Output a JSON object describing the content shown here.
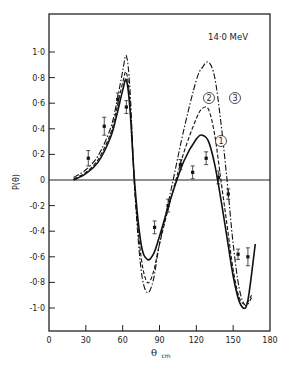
{
  "chart_data": {
    "type": "line",
    "title": "14·0 MeV",
    "xlabel": "θ",
    "xlabel_sub": "cm",
    "ylabel": "P(θ)",
    "xlim": [
      0,
      180
    ],
    "ylim": [
      -1.2,
      1.2
    ],
    "x_ticks": [
      0,
      30,
      60,
      90,
      120,
      150,
      180
    ],
    "x_tick_labels": [
      "0",
      "30",
      "60",
      "90",
      "120",
      "150",
      "180"
    ],
    "y_ticks": [
      1.0,
      0.8,
      0.6,
      0.4,
      0.2,
      0,
      -0.2,
      -0.4,
      -0.6,
      -0.8,
      -1.0
    ],
    "y_tick_labels": [
      "1·0",
      "0·8",
      "0·6",
      "0·4",
      "0·2",
      "0",
      "-0·2",
      "-0·4",
      "-0·6",
      "-0·8",
      "-1·0"
    ],
    "grid": false,
    "legend": "curve labels circled 1, 2, 3",
    "series": [
      {
        "name": "1",
        "style": "solid",
        "x": [
          20,
          30,
          40,
          50,
          55,
          60,
          63,
          66,
          70,
          75,
          80,
          85,
          90,
          100,
          110,
          120,
          125,
          130,
          135,
          140,
          145,
          150,
          155,
          160,
          163,
          168
        ],
        "y": [
          0.0,
          0.05,
          0.14,
          0.33,
          0.5,
          0.7,
          0.78,
          0.55,
          -0.05,
          -0.5,
          -0.62,
          -0.58,
          -0.44,
          -0.12,
          0.15,
          0.32,
          0.35,
          0.3,
          0.12,
          -0.15,
          -0.45,
          -0.75,
          -0.95,
          -1.0,
          -0.88,
          -0.5
        ]
      },
      {
        "name": "2",
        "style": "dashed",
        "x": [
          20,
          30,
          40,
          50,
          55,
          60,
          63,
          66,
          70,
          75,
          80,
          85,
          90,
          100,
          110,
          120,
          125,
          130,
          135,
          140,
          145,
          150,
          155,
          160,
          165
        ],
        "y": [
          0.01,
          0.06,
          0.16,
          0.36,
          0.55,
          0.76,
          0.84,
          0.6,
          -0.1,
          -0.6,
          -0.8,
          -0.72,
          -0.5,
          -0.12,
          0.22,
          0.48,
          0.56,
          0.55,
          0.35,
          0.0,
          -0.35,
          -0.7,
          -0.92,
          -0.97,
          -0.9
        ]
      },
      {
        "name": "3",
        "style": "dash-dot",
        "x": [
          20,
          30,
          40,
          50,
          55,
          60,
          63,
          66,
          70,
          75,
          80,
          85,
          90,
          100,
          110,
          120,
          125,
          130,
          135,
          140,
          145,
          150,
          155,
          160,
          165
        ],
        "y": [
          0.02,
          0.08,
          0.19,
          0.4,
          0.6,
          0.85,
          0.97,
          0.7,
          -0.1,
          -0.7,
          -0.88,
          -0.78,
          -0.5,
          -0.05,
          0.4,
          0.78,
          0.88,
          0.92,
          0.8,
          0.45,
          0.0,
          -0.5,
          -0.85,
          -0.98,
          -0.92
        ]
      }
    ],
    "data_points": [
      {
        "x": 32,
        "y": 0.17,
        "err": 0.06
      },
      {
        "x": 45,
        "y": 0.42,
        "err": 0.07
      },
      {
        "x": 56,
        "y": 0.63,
        "err": 0.05
      },
      {
        "x": 63,
        "y": 0.57,
        "err": 0.05
      },
      {
        "x": 86,
        "y": -0.37,
        "err": 0.05
      },
      {
        "x": 97,
        "y": -0.2,
        "err": 0.05
      },
      {
        "x": 107,
        "y": 0.12,
        "err": 0.04
      },
      {
        "x": 117,
        "y": 0.06,
        "err": 0.05
      },
      {
        "x": 128,
        "y": 0.17,
        "err": 0.05
      },
      {
        "x": 138,
        "y": 0.02,
        "err": 0.05
      },
      {
        "x": 146,
        "y": -0.11,
        "err": 0.04
      },
      {
        "x": 154,
        "y": -0.58,
        "err": 0.04
      },
      {
        "x": 162,
        "y": -0.6,
        "err": 0.07
      }
    ],
    "annotations": [
      "14·0 MeV",
      "①",
      "②",
      "③"
    ]
  },
  "labels": {
    "energy": "14·0 MeV",
    "ylabel": "P(θ)",
    "xlabel": "θ",
    "xlabel_sub": "cm",
    "curve1": "1",
    "curve2": "2",
    "curve3": "3"
  }
}
